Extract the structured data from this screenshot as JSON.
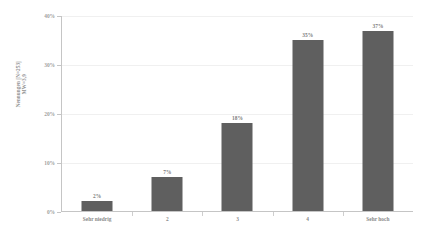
{
  "chart_data": {
    "type": "bar",
    "title": "",
    "subtitle": "",
    "categories": [
      "Sehr niedrig",
      "2",
      "3",
      "4",
      "Sehr hoch"
    ],
    "values": [
      2,
      7,
      18,
      35,
      37
    ],
    "data_labels": [
      "2%",
      "7%",
      "18%",
      "35%",
      "37%"
    ],
    "xlabel": "",
    "ylabel": "Nennungen [N=253]",
    "ylabel_line2": "MW=3,9",
    "ylim": [
      0,
      40
    ],
    "ytick_values": [
      0,
      10,
      20,
      30,
      40
    ],
    "ytick_labels": [
      "0%",
      "10%",
      "20%",
      "30%",
      "40%"
    ],
    "grid": true,
    "legend": "none",
    "bar_color": "#3c3c3c",
    "axis_color": "#b9b9b9",
    "grid_color": "#ededed",
    "text_color": "#6f6f6f",
    "background": "#ffffff"
  }
}
